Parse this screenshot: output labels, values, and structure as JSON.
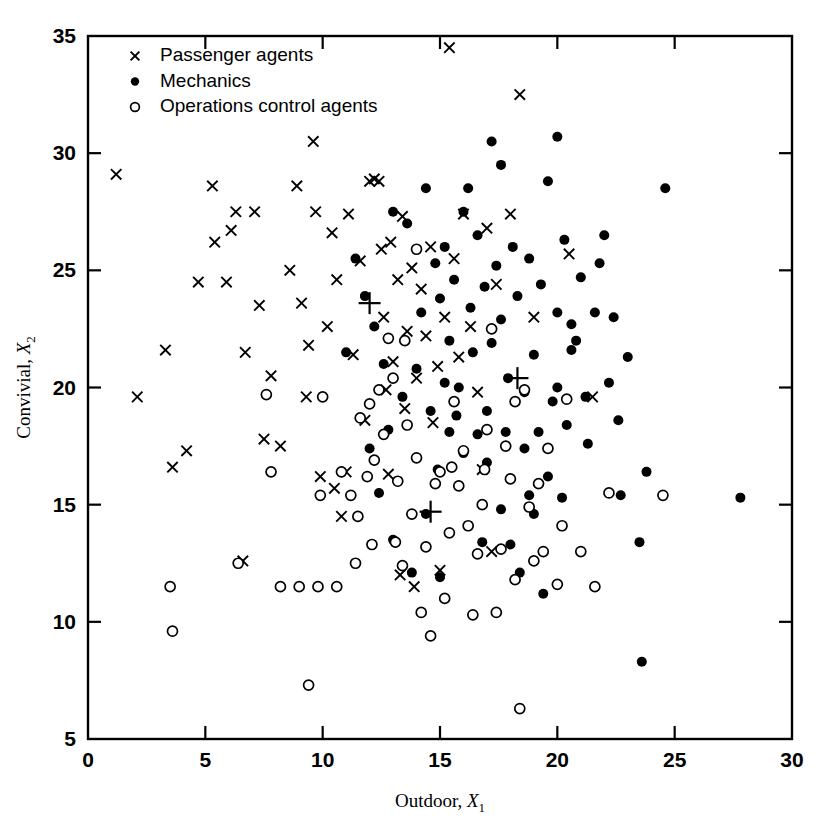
{
  "chart_data": {
    "type": "scatter",
    "title": "",
    "xlabel": "Outdoor, X",
    "xlabel_sub": "1",
    "ylabel": "Convivial, X",
    "ylabel_sub": "2",
    "xlim": [
      0,
      30
    ],
    "ylim": [
      5,
      35
    ],
    "xticks": [
      0,
      5,
      10,
      15,
      20,
      25,
      30
    ],
    "yticks": [
      5,
      10,
      15,
      20,
      25,
      30,
      35
    ],
    "grid": false,
    "legend_position": "top-left",
    "legend": [
      {
        "marker": "cross-marker",
        "label": "Passenger agents"
      },
      {
        "marker": "filled-circle-marker",
        "label": "Mechanics"
      },
      {
        "marker": "open-circle-marker",
        "label": "Operations control agents"
      }
    ],
    "series": [
      {
        "name": "Passenger agents",
        "marker": "cross",
        "points": [
          [
            1.2,
            29.1
          ],
          [
            3.3,
            21.6
          ],
          [
            2.1,
            19.6
          ],
          [
            3.6,
            16.6
          ],
          [
            4.2,
            17.3
          ],
          [
            4.7,
            24.5
          ],
          [
            5.4,
            26.2
          ],
          [
            5.3,
            28.6
          ],
          [
            5.9,
            24.5
          ],
          [
            6.1,
            26.7
          ],
          [
            6.3,
            27.5
          ],
          [
            6.7,
            21.5
          ],
          [
            6.6,
            12.6
          ],
          [
            7.1,
            27.5
          ],
          [
            7.3,
            23.5
          ],
          [
            7.5,
            17.8
          ],
          [
            7.8,
            20.5
          ],
          [
            8.2,
            17.5
          ],
          [
            8.6,
            25.0
          ],
          [
            8.9,
            28.6
          ],
          [
            9.1,
            23.6
          ],
          [
            9.3,
            19.6
          ],
          [
            9.4,
            21.8
          ],
          [
            9.6,
            30.5
          ],
          [
            9.7,
            27.5
          ],
          [
            9.9,
            16.2
          ],
          [
            10.2,
            22.6
          ],
          [
            10.4,
            26.6
          ],
          [
            10.6,
            24.6
          ],
          [
            10.8,
            14.5
          ],
          [
            11.1,
            27.4
          ],
          [
            11.3,
            21.4
          ],
          [
            11.6,
            25.4
          ],
          [
            11.8,
            18.6
          ],
          [
            12.0,
            28.8
          ],
          [
            12.2,
            28.9
          ],
          [
            12.4,
            28.8
          ],
          [
            12.5,
            25.9
          ],
          [
            12.6,
            23.0
          ],
          [
            12.7,
            19.9
          ],
          [
            12.9,
            26.2
          ],
          [
            13.0,
            21.1
          ],
          [
            13.2,
            24.6
          ],
          [
            13.3,
            12.0
          ],
          [
            13.4,
            27.3
          ],
          [
            13.5,
            19.1
          ],
          [
            13.6,
            22.4
          ],
          [
            13.8,
            25.1
          ],
          [
            13.9,
            11.5
          ],
          [
            14.0,
            20.4
          ],
          [
            14.2,
            24.2
          ],
          [
            14.4,
            22.2
          ],
          [
            14.6,
            26.0
          ],
          [
            14.7,
            18.5
          ],
          [
            14.9,
            20.9
          ],
          [
            15.0,
            12.2
          ],
          [
            15.2,
            23.0
          ],
          [
            15.4,
            34.5
          ],
          [
            15.6,
            25.5
          ],
          [
            15.8,
            21.3
          ],
          [
            16.0,
            27.4
          ],
          [
            16.3,
            22.6
          ],
          [
            16.6,
            19.8
          ],
          [
            17.0,
            26.8
          ],
          [
            17.4,
            24.4
          ],
          [
            18.0,
            27.4
          ],
          [
            18.4,
            32.5
          ],
          [
            19.0,
            23.0
          ],
          [
            20.5,
            25.7
          ],
          [
            21.5,
            19.6
          ],
          [
            16.8,
            16.5
          ],
          [
            12.8,
            16.3
          ],
          [
            11.0,
            16.4
          ],
          [
            10.5,
            15.7
          ],
          [
            17.2,
            13.0
          ]
        ]
      },
      {
        "name": "Mechanics",
        "marker": "filled-circle",
        "points": [
          [
            13.0,
            27.5
          ],
          [
            13.6,
            27.0
          ],
          [
            14.4,
            28.5
          ],
          [
            14.8,
            25.3
          ],
          [
            15.2,
            26.0
          ],
          [
            15.0,
            23.8
          ],
          [
            15.4,
            22.0
          ],
          [
            15.6,
            24.6
          ],
          [
            16.0,
            27.5
          ],
          [
            16.3,
            23.4
          ],
          [
            16.6,
            26.5
          ],
          [
            16.9,
            24.3
          ],
          [
            17.2,
            21.9
          ],
          [
            17.4,
            25.2
          ],
          [
            17.6,
            22.9
          ],
          [
            17.9,
            20.4
          ],
          [
            18.1,
            26.0
          ],
          [
            18.3,
            23.9
          ],
          [
            18.6,
            19.8
          ],
          [
            18.8,
            25.5
          ],
          [
            19.0,
            21.4
          ],
          [
            19.3,
            24.4
          ],
          [
            19.6,
            28.8
          ],
          [
            19.8,
            19.4
          ],
          [
            20.0,
            23.2
          ],
          [
            20.3,
            26.3
          ],
          [
            20.6,
            21.6
          ],
          [
            21.0,
            24.7
          ],
          [
            21.2,
            19.6
          ],
          [
            21.6,
            23.2
          ],
          [
            22.0,
            26.5
          ],
          [
            22.2,
            20.2
          ],
          [
            22.6,
            18.6
          ],
          [
            23.0,
            21.3
          ],
          [
            23.5,
            13.4
          ],
          [
            23.8,
            16.4
          ],
          [
            24.6,
            28.5
          ],
          [
            23.6,
            8.3
          ],
          [
            27.8,
            15.3
          ],
          [
            22.7,
            15.4
          ],
          [
            21.3,
            17.6
          ],
          [
            20.4,
            18.4
          ],
          [
            19.6,
            16.2
          ],
          [
            19.0,
            14.6
          ],
          [
            18.4,
            12.1
          ],
          [
            19.4,
            11.2
          ],
          [
            18.0,
            13.3
          ],
          [
            17.6,
            14.8
          ],
          [
            17.0,
            16.8
          ],
          [
            16.6,
            18.0
          ],
          [
            16.0,
            17.2
          ],
          [
            15.4,
            18.1
          ],
          [
            14.9,
            16.5
          ],
          [
            14.4,
            14.6
          ],
          [
            13.8,
            12.1
          ],
          [
            13.0,
            13.5
          ],
          [
            12.4,
            15.5
          ],
          [
            12.0,
            17.4
          ],
          [
            12.8,
            18.2
          ],
          [
            13.4,
            19.6
          ],
          [
            14.0,
            20.8
          ],
          [
            14.6,
            19.0
          ],
          [
            15.2,
            20.2
          ],
          [
            15.8,
            20.0
          ],
          [
            16.4,
            21.5
          ],
          [
            17.0,
            19.0
          ],
          [
            17.8,
            18.1
          ],
          [
            18.6,
            17.4
          ],
          [
            19.2,
            18.1
          ],
          [
            20.0,
            20.0
          ],
          [
            20.6,
            22.7
          ],
          [
            12.2,
            22.6
          ],
          [
            11.8,
            23.9
          ],
          [
            11.4,
            25.5
          ],
          [
            12.6,
            21.0
          ],
          [
            11.0,
            21.5
          ],
          [
            14.2,
            23.2
          ],
          [
            16.2,
            28.5
          ],
          [
            17.2,
            30.5
          ],
          [
            17.6,
            29.5
          ],
          [
            20.0,
            30.7
          ],
          [
            20.8,
            22.0
          ],
          [
            21.8,
            25.3
          ],
          [
            22.4,
            23.0
          ],
          [
            15.7,
            18.8
          ],
          [
            16.8,
            13.4
          ],
          [
            15.0,
            11.9
          ],
          [
            18.8,
            15.4
          ],
          [
            20.2,
            15.3
          ]
        ]
      },
      {
        "name": "Operations control agents",
        "marker": "open-circle",
        "points": [
          [
            3.5,
            11.5
          ],
          [
            3.6,
            9.6
          ],
          [
            6.4,
            12.5
          ],
          [
            7.6,
            19.7
          ],
          [
            7.8,
            16.4
          ],
          [
            8.2,
            11.5
          ],
          [
            9.0,
            11.5
          ],
          [
            9.4,
            7.3
          ],
          [
            9.8,
            11.5
          ],
          [
            9.9,
            15.4
          ],
          [
            10.6,
            11.5
          ],
          [
            11.2,
            15.4
          ],
          [
            11.6,
            18.7
          ],
          [
            11.4,
            12.5
          ],
          [
            12.0,
            19.3
          ],
          [
            12.2,
            16.9
          ],
          [
            12.6,
            18.0
          ],
          [
            12.8,
            22.1
          ],
          [
            13.0,
            20.4
          ],
          [
            13.2,
            16.0
          ],
          [
            13.4,
            12.4
          ],
          [
            13.6,
            18.4
          ],
          [
            13.8,
            14.6
          ],
          [
            14.0,
            17.0
          ],
          [
            14.2,
            10.4
          ],
          [
            14.4,
            13.2
          ],
          [
            14.6,
            9.4
          ],
          [
            14.8,
            15.9
          ],
          [
            15.0,
            16.4
          ],
          [
            15.2,
            11.0
          ],
          [
            15.4,
            13.8
          ],
          [
            15.6,
            19.4
          ],
          [
            15.8,
            15.8
          ],
          [
            16.0,
            17.3
          ],
          [
            16.2,
            14.1
          ],
          [
            16.4,
            10.3
          ],
          [
            16.6,
            12.9
          ],
          [
            16.8,
            15.0
          ],
          [
            17.0,
            18.2
          ],
          [
            17.2,
            22.5
          ],
          [
            17.4,
            10.4
          ],
          [
            17.6,
            13.1
          ],
          [
            18.0,
            16.1
          ],
          [
            18.2,
            11.8
          ],
          [
            18.4,
            6.3
          ],
          [
            18.6,
            19.9
          ],
          [
            18.8,
            14.9
          ],
          [
            19.0,
            12.6
          ],
          [
            19.2,
            15.9
          ],
          [
            19.4,
            13.0
          ],
          [
            19.6,
            17.4
          ],
          [
            20.0,
            11.6
          ],
          [
            20.2,
            14.1
          ],
          [
            20.4,
            19.5
          ],
          [
            21.0,
            13.0
          ],
          [
            21.6,
            11.5
          ],
          [
            22.2,
            15.5
          ],
          [
            24.5,
            15.4
          ],
          [
            18.2,
            19.4
          ],
          [
            14.0,
            25.9
          ],
          [
            13.5,
            22.0
          ],
          [
            12.4,
            19.9
          ],
          [
            11.9,
            16.2
          ],
          [
            10.8,
            16.4
          ],
          [
            10.0,
            19.6
          ],
          [
            15.5,
            16.6
          ],
          [
            16.9,
            16.5
          ],
          [
            17.8,
            17.5
          ],
          [
            13.1,
            13.4
          ],
          [
            12.1,
            13.3
          ],
          [
            11.5,
            14.5
          ]
        ]
      }
    ],
    "centroids": {
      "marker": "plus",
      "points": [
        [
          12.0,
          23.6
        ],
        [
          18.3,
          20.4
        ],
        [
          14.6,
          14.7
        ]
      ]
    }
  }
}
